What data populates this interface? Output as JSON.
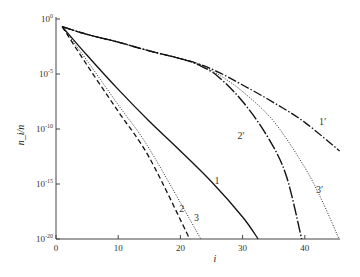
{
  "chart_data": {
    "type": "line",
    "title": "",
    "xlabel": "i",
    "ylabel": "n_i/n",
    "y_scale": "log",
    "xlim": [
      0,
      45.5
    ],
    "ylim_log10": [
      -20,
      0
    ],
    "x_ticks": [
      {
        "value": 0,
        "label": "0"
      },
      {
        "value": 10,
        "label": "10"
      },
      {
        "value": 20,
        "label": "20"
      },
      {
        "value": 30,
        "label": "30"
      },
      {
        "value": 40,
        "label": "40"
      }
    ],
    "y_ticks": [
      {
        "log": 0,
        "base": "10",
        "exp": "0"
      },
      {
        "log": -5,
        "base": "10",
        "exp": "-5"
      },
      {
        "log": -10,
        "base": "10",
        "exp": "-10"
      },
      {
        "log": -15,
        "base": "10",
        "exp": "-15"
      },
      {
        "log": -20,
        "base": "10",
        "exp": "-20"
      }
    ],
    "grid": false,
    "series": [
      {
        "name": "1",
        "label": "1",
        "style": "solid",
        "points_log10": [
          [
            1,
            -0.7
          ],
          [
            5,
            -3.3
          ],
          [
            10,
            -6.4
          ],
          [
            15,
            -9.3
          ],
          [
            20,
            -12.0
          ],
          [
            25,
            -14.8
          ],
          [
            30,
            -18.0
          ],
          [
            32.5,
            -20
          ]
        ],
        "label_at": [
          25.5,
          -15.0
        ]
      },
      {
        "name": "2",
        "label": "2",
        "style": "dashed",
        "points_log10": [
          [
            1,
            -0.7
          ],
          [
            5,
            -4.2
          ],
          [
            10,
            -8.4
          ],
          [
            15,
            -12.6
          ],
          [
            21.5,
            -20
          ]
        ],
        "label_at": [
          19.8,
          -17.5
        ]
      },
      {
        "name": "3",
        "label": "3",
        "style": "dotted",
        "points_log10": [
          [
            1,
            -0.7
          ],
          [
            5,
            -3.8
          ],
          [
            10,
            -7.8
          ],
          [
            15,
            -11.8
          ],
          [
            23.3,
            -20
          ]
        ],
        "label_at": [
          22.2,
          -18.4
        ]
      },
      {
        "name": "1'",
        "label": "1′",
        "style": "dash-dot",
        "points_log10": [
          [
            1,
            -0.7
          ],
          [
            5,
            -1.4
          ],
          [
            10,
            -2.1
          ],
          [
            15,
            -2.9
          ],
          [
            20,
            -3.6
          ],
          [
            23,
            -4.1
          ],
          [
            26,
            -4.8
          ],
          [
            30,
            -6.0
          ],
          [
            35,
            -7.6
          ],
          [
            40,
            -9.4
          ],
          [
            45.6,
            -12.0
          ]
        ],
        "label_at": [
          42.3,
          -9.6
        ]
      },
      {
        "name": "2'",
        "label": "2′",
        "style": "dash-dot-dot",
        "points_log10": [
          [
            1,
            -0.7
          ],
          [
            5,
            -1.4
          ],
          [
            10,
            -2.1
          ],
          [
            15,
            -2.9
          ],
          [
            20,
            -3.6
          ],
          [
            23,
            -4.2
          ],
          [
            26,
            -5.2
          ],
          [
            30,
            -7.5
          ],
          [
            34,
            -10.7
          ],
          [
            37,
            -14.2
          ],
          [
            39.5,
            -20
          ]
        ],
        "label_at": [
          29.2,
          -10.9
        ]
      },
      {
        "name": "3'",
        "label": "3′",
        "style": "dotted",
        "points_log10": [
          [
            1,
            -0.7
          ],
          [
            5,
            -1.4
          ],
          [
            10,
            -2.1
          ],
          [
            15,
            -2.9
          ],
          [
            20,
            -3.6
          ],
          [
            23,
            -4.1
          ],
          [
            26,
            -5.0
          ],
          [
            30,
            -6.6
          ],
          [
            35,
            -9.3
          ],
          [
            40,
            -13.5
          ],
          [
            43,
            -16.8
          ],
          [
            45.5,
            -20
          ]
        ],
        "label_at": [
          41.8,
          -15.8
        ]
      }
    ]
  }
}
